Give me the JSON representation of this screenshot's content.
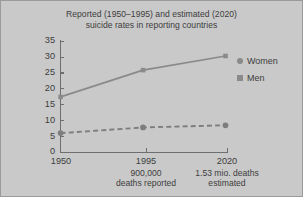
{
  "chart_data": {
    "type": "line",
    "title": "Reported (1950–1995) and estimated (2020) suicide rates in reporting countries",
    "title_line1": "Reported (1950–1995) and estimated (2020)",
    "title_line2": "suicide rates in reporting countries",
    "xlabel": "",
    "ylabel": "",
    "x": [
      1950,
      1995,
      2020
    ],
    "categories": [
      "1950",
      "1995",
      "2020"
    ],
    "xtick_labels": [
      "1950",
      "1995",
      "2020"
    ],
    "xtick_sublabels": [
      {
        "line1": "",
        "line2": ""
      },
      {
        "line1": "900,000",
        "line2": "deaths reported"
      },
      {
        "line1": "1.53 mio. deaths",
        "line2": "estimated"
      }
    ],
    "ytick_labels": [
      "0",
      "5",
      "10",
      "15",
      "20",
      "25",
      "30",
      "35"
    ],
    "yticks": [
      0,
      5,
      10,
      15,
      20,
      25,
      30,
      35
    ],
    "ylim": [
      0,
      35
    ],
    "grid": false,
    "legend_position": "right",
    "series": [
      {
        "name": "Women",
        "values": [
          17.0,
          25.5,
          30.0
        ],
        "marker": "square",
        "line_style": "solid",
        "color": "#8a8a8a"
      },
      {
        "name": "Men",
        "values": [
          5.5,
          7.3,
          8.0
        ],
        "marker": "circle",
        "line_style": "dashed",
        "color": "#7d7d7d"
      }
    ]
  },
  "legend": {
    "items": [
      {
        "label": "Women",
        "marker": "circle"
      },
      {
        "label": "Men",
        "marker": "square"
      }
    ]
  },
  "colors": {
    "background": "#c9c9c9",
    "axis": "#6e6e6e",
    "text": "#3d3d3d",
    "series_upper": "#8a8a8a",
    "series_lower": "#7d7d7d",
    "frame": "#9a9a9a"
  }
}
